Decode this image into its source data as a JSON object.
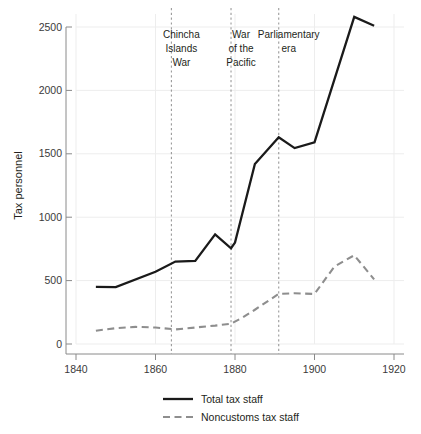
{
  "chart_data": {
    "type": "line",
    "title": "",
    "subtitle": "",
    "xlabel": "",
    "ylabel": "Tax personnel",
    "xlim": [
      1840,
      1920
    ],
    "ylim": [
      0,
      2600
    ],
    "grid": true,
    "legend_position": "bottom",
    "x_ticks": [
      1840,
      1860,
      1880,
      1900,
      1920
    ],
    "x_tick_labels": [
      "1840",
      "1860",
      "1880",
      "1900",
      "1920"
    ],
    "y_ticks": [
      0,
      500,
      1000,
      1500,
      2000,
      2500
    ],
    "y_tick_labels": [
      "0",
      "500",
      "1000",
      "1500",
      "2000",
      "2500"
    ],
    "series": [
      {
        "name": "Total tax staff",
        "style": "solid",
        "color": "#1a1a1a",
        "x": [
          1845,
          1850,
          1860,
          1865,
          1870,
          1875,
          1879,
          1880,
          1885,
          1891,
          1895,
          1900,
          1910,
          1915
        ],
        "values": [
          450,
          448,
          570,
          650,
          655,
          865,
          755,
          800,
          1420,
          1630,
          1545,
          1590,
          2580,
          2510
        ]
      },
      {
        "name": "Noncustoms tax staff",
        "style": "dashed",
        "color": "#8e8e8e",
        "x": [
          1845,
          1850,
          1855,
          1860,
          1865,
          1870,
          1875,
          1879,
          1882,
          1885,
          1891,
          1895,
          1900,
          1905,
          1910,
          1915
        ],
        "values": [
          105,
          125,
          135,
          130,
          115,
          130,
          145,
          160,
          210,
          270,
          395,
          400,
          395,
          610,
          700,
          510
        ]
      }
    ],
    "annotations": [
      {
        "label": "Chincha\nIslands\nWar",
        "lines": [
          "Chincha",
          "Islands",
          "War"
        ],
        "x": 1864,
        "line_style": "dashed"
      },
      {
        "label": "War\nof the\nPacific",
        "lines": [
          "War",
          "of the",
          "Pacific"
        ],
        "x": 1879,
        "line_style": "dashed"
      },
      {
        "label": "Parliamentary\nera",
        "lines": [
          "Parliamentary",
          "era"
        ],
        "x": 1891,
        "line_style": "dashed"
      }
    ],
    "legend": [
      {
        "label": "Total tax staff",
        "style": "solid",
        "color": "#1a1a1a"
      },
      {
        "label": "Noncustoms tax staff",
        "style": "dashed",
        "color": "#8e8e8e"
      }
    ],
    "colors": {
      "background": "#ffffff",
      "axis": "#8a8a8a",
      "grid": "#ededed",
      "text": "#231f20",
      "event_line": "#9a9a9a"
    }
  }
}
